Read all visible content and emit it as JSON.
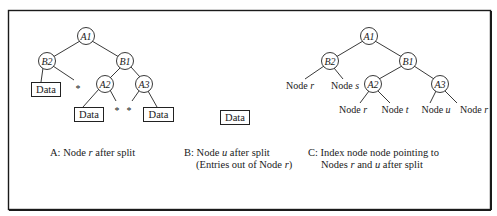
{
  "figure": {
    "panels": {
      "a": {
        "caption": "A: Node r after split",
        "caption_parts": [
          "A: Node ",
          "r",
          " after split"
        ],
        "nodes": {
          "root": "A1",
          "left": "B2",
          "right": "B1",
          "right_left": "A2",
          "right_right": "A3"
        },
        "data_label": "Data",
        "empty_pointer": "*"
      },
      "b": {
        "caption_line1_parts": [
          "B: Node ",
          "u",
          " after split"
        ],
        "caption_line2_parts": [
          "(Entries out of Node ",
          "r",
          ")"
        ],
        "data_label": "Data"
      },
      "c": {
        "caption_line1": "C: Index node node pointing to",
        "caption_line2_parts": [
          "Nodes ",
          "r",
          " and ",
          "u",
          " after split"
        ],
        "nodes": {
          "root": "A1",
          "left": "B2",
          "right": "B1",
          "right_left": "A2",
          "right_right": "A3"
        },
        "leaves": {
          "b2_left": {
            "prefix": "Node ",
            "var": "r"
          },
          "b2_right": {
            "prefix": "Node ",
            "var": "s"
          },
          "a2_left": {
            "prefix": "Node ",
            "var": "r"
          },
          "a2_right": {
            "prefix": "Node ",
            "var": "t"
          },
          "a3_left": {
            "prefix": "Node ",
            "var": "u"
          },
          "a3_right": {
            "prefix": "Node ",
            "var": "r"
          }
        }
      }
    }
  }
}
